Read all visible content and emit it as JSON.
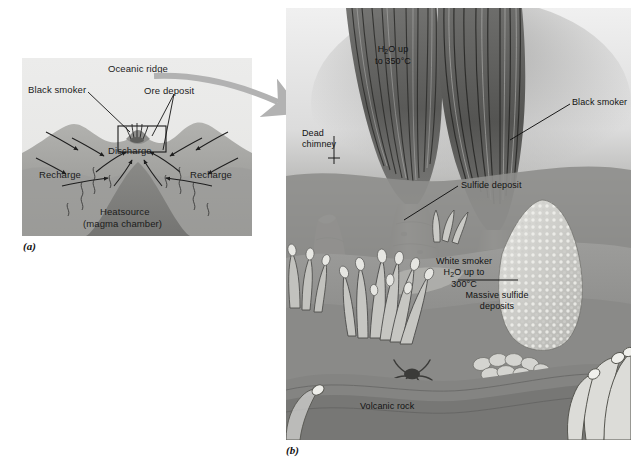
{
  "figure": {
    "panels": [
      {
        "id": "a",
        "caption": "(a)",
        "description": "Cross-section of oceanic ridge hydrothermal circulation"
      },
      {
        "id": "b",
        "caption": "(b)",
        "description": "Detail of black smoker vent field on the seafloor"
      }
    ]
  },
  "panel_a": {
    "caption": "(a)",
    "labels": {
      "oceanic_ridge": "Oceanic ridge",
      "black_smoker": "Black smoker",
      "ore_deposit": "Ore deposit",
      "discharge": "Discharge",
      "recharge_left": "Recharge",
      "recharge_right": "Recharge",
      "heatsource_line1": "Heatsource",
      "heatsource_line2": "(magma chamber)"
    },
    "colors": {
      "background": "#e9e9e7",
      "crust_upper": "#a9a9a7",
      "crust_lower": "#9a9a98",
      "magma": "#7b7b79",
      "ink": "#1b1b1b"
    }
  },
  "panel_b": {
    "caption": "(b)",
    "labels": {
      "h2o_up_line1": "H",
      "h2o_up_sub": "2",
      "h2o_up_line1b": "O up",
      "h2o_up_line2": "to 350°C",
      "black_smoker": "Black smoker",
      "dead_chimney_line1": "Dead",
      "dead_chimney_line2": "chimney",
      "sulfide_deposit": "Sulfide deposit",
      "white_smoker_line1": "White smoker",
      "white_smoker_line2a": "H",
      "white_smoker_line2sub": "2",
      "white_smoker_line2b": "O up to",
      "white_smoker_line3": "300°C",
      "massive_sulfide_line1": "Massive sulfide",
      "massive_sulfide_line2": "deposits",
      "volcanic_rock": "Volcanic rock"
    },
    "colors": {
      "water_background": "#c9c9c9",
      "seafloor": "#8d8d8b",
      "plume_dark": "#5a5a58",
      "chimney": "#a8a6a0",
      "mound_light": "#cfcfcb",
      "ink": "#121212"
    }
  },
  "connector": {
    "name": "magnification-arrow",
    "color": "#b2b2b2"
  },
  "footer_faint": " "
}
